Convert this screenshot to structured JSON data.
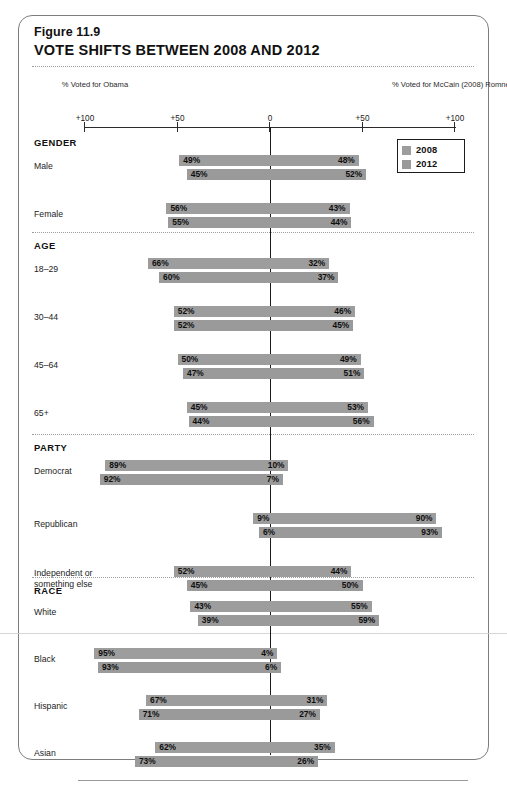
{
  "figure": {
    "number": "Figure 11.9",
    "title": "VOTE SHIFTS BETWEEN 2008 AND 2012"
  },
  "axis": {
    "left_caption": "% Voted for\nObama",
    "right_caption": "% Voted for\nMcCain (2008)\nRomney (2012)",
    "ticks": [
      {
        "label": "+100",
        "value": -100
      },
      {
        "label": "+50",
        "value": -50
      },
      {
        "label": "0",
        "value": 0
      },
      {
        "label": "+50",
        "value": 50
      },
      {
        "label": "+100",
        "value": 100
      }
    ]
  },
  "legend": {
    "items": [
      {
        "label": "2008",
        "color": "#9d9d9d"
      },
      {
        "label": "2012",
        "color": "#9a9a9a"
      }
    ]
  },
  "colors": {
    "bar_2008": "#9d9d9d",
    "bar_2012": "#9a9a9a",
    "zero_line": "#1a1a1a",
    "card_border": "#7d7d7d",
    "text": "#1a1a1a"
  },
  "chart_data": {
    "type": "bar",
    "title": "VOTE SHIFTS BETWEEN 2008 AND 2012",
    "subtitle": "Figure 11.9",
    "orientation": "horizontal-diverging",
    "xlabel": "",
    "ylabel": "",
    "xlim": [
      -100,
      100
    ],
    "xticks": [
      -100,
      -50,
      0,
      50,
      100
    ],
    "xticklabels": [
      "+100",
      "+50",
      "0",
      "+50",
      "+100"
    ],
    "grid": false,
    "legend_position": "top-right",
    "left_side_meaning": "% Voted for Obama",
    "right_side_meaning": "% Voted for McCain (2008) / Romney (2012)",
    "series": [
      {
        "name": "2008",
        "color": "#9d9d9d"
      },
      {
        "name": "2012",
        "color": "#9a9a9a"
      }
    ],
    "sections": [
      {
        "name": "GENDER",
        "rows": [
          {
            "label": "Male",
            "2008": {
              "left": 49,
              "right": 48
            },
            "2012": {
              "left": 45,
              "right": 52
            }
          },
          {
            "label": "Female",
            "2008": {
              "left": 56,
              "right": 43
            },
            "2012": {
              "left": 55,
              "right": 44
            }
          }
        ]
      },
      {
        "name": "AGE",
        "rows": [
          {
            "label": "18–29",
            "2008": {
              "left": 66,
              "right": 32
            },
            "2012": {
              "left": 60,
              "right": 37
            }
          },
          {
            "label": "30–44",
            "2008": {
              "left": 52,
              "right": 46
            },
            "2012": {
              "left": 52,
              "right": 45
            }
          },
          {
            "label": "45–64",
            "2008": {
              "left": 50,
              "right": 49
            },
            "2012": {
              "left": 47,
              "right": 51
            }
          },
          {
            "label": "65+",
            "2008": {
              "left": 45,
              "right": 53
            },
            "2012": {
              "left": 44,
              "right": 56
            }
          }
        ]
      },
      {
        "name": "PARTY",
        "rows": [
          {
            "label": "Democrat",
            "2008": {
              "left": 89,
              "right": 10
            },
            "2012": {
              "left": 92,
              "right": 7
            }
          },
          {
            "label": "Republican",
            "2008": {
              "left": 9,
              "right": 90
            },
            "2012": {
              "left": 6,
              "right": 93
            }
          },
          {
            "label": "Independent or\nsomething else",
            "2008": {
              "left": 52,
              "right": 44
            },
            "2012": {
              "left": 45,
              "right": 50
            }
          }
        ]
      },
      {
        "name": "RACE",
        "rows": [
          {
            "label": "White",
            "2008": {
              "left": 43,
              "right": 55
            },
            "2012": {
              "left": 39,
              "right": 59
            }
          },
          {
            "label": "Black",
            "2008": {
              "left": 95,
              "right": 4
            },
            "2012": {
              "left": 93,
              "right": 6
            }
          },
          {
            "label": "Hispanic",
            "2008": {
              "left": 67,
              "right": 31
            },
            "2012": {
              "left": 71,
              "right": 27
            }
          },
          {
            "label": "Asian",
            "2008": {
              "left": 62,
              "right": 35
            },
            "2012": {
              "left": 73,
              "right": 26
            }
          }
        ]
      }
    ]
  }
}
